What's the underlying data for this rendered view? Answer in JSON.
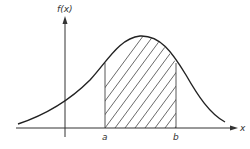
{
  "figure": {
    "type": "area-under-curve diagram",
    "y_axis_label": "f(x)",
    "x_axis_label": "x",
    "lower_bound_label": "a",
    "upper_bound_label": "b",
    "curve": "bell-shaped (normal-like) density",
    "shaded_region": "area under f(x) between a and b, diagonal hatching",
    "colors": {
      "ink": "#333333",
      "background": "#ffffff"
    }
  }
}
